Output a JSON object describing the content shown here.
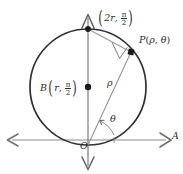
{
  "figure": {
    "type": "geometry-diagram",
    "width": 183,
    "height": 174,
    "background_color": "#ffffff"
  },
  "labels": {
    "top_point": {
      "name": "top-point-label",
      "text": "(2r, π/2)",
      "coordinate_r": "2r",
      "coordinate_theta": "π/2",
      "r_symbol": "2r",
      "theta_num": "π",
      "theta_den": "2",
      "open_paren": "(",
      "close_paren": ")",
      "comma": ", "
    },
    "p_point": {
      "name": "p-point-label",
      "text": "P(ρ, θ)",
      "point_name": "P",
      "open_paren": "(",
      "rho": "ρ",
      "comma": ", ",
      "theta": "θ",
      "close_paren": ")"
    },
    "b_center": {
      "name": "b-center-label",
      "text": "B(r, π/2)",
      "point_name": "B",
      "open_paren": "(",
      "r_symbol": "r",
      "comma": ", ",
      "theta_num": "π",
      "theta_den": "2",
      "close_paren": ")"
    },
    "rho_segment": {
      "name": "rho-segment-label",
      "text": "ρ"
    },
    "theta_angle": {
      "name": "theta-angle-label",
      "text": "θ"
    },
    "origin": {
      "name": "origin-label",
      "text": "O"
    },
    "polar_axis": {
      "name": "polar-axis-label",
      "text": "A"
    }
  },
  "colors": {
    "circle_stroke": "#2f2f2f",
    "axis_stroke": "#8a8a8a",
    "vertical_axis_stroke": "#6f6f6f",
    "radius_line_stroke": "#8f8f8f",
    "chord_stroke": "#9a9a9a",
    "point_fill": "#1a1a1a",
    "text_color": "#2b2b2b",
    "right_angle_stroke": "#7a7a7a"
  },
  "geometry": {
    "circle": {
      "name": "main-circle",
      "center_x": 88,
      "center_y": 87,
      "radius": 58
    },
    "center_point": {
      "name": "center-point-b",
      "x": 88,
      "y": 87,
      "radius": 3.1
    },
    "top_point": {
      "name": "circle-top-point",
      "x": 88,
      "y": 29,
      "radius": 2.8
    },
    "p_point": {
      "name": "point-p",
      "x": 131,
      "y": 52,
      "radius": 3.1
    },
    "origin_point": {
      "name": "origin-point",
      "x": 88,
      "y": 145
    },
    "horizontal_axis": {
      "name": "polar-axis-line",
      "x1": 6,
      "y1": 140,
      "x2": 172,
      "y2": 140
    },
    "vertical_axis": {
      "name": "vertical-axis-line",
      "x1": 88,
      "y1": 14,
      "x2": 88,
      "y2": 170
    },
    "radius_line": {
      "name": "rho-line",
      "x1": 88,
      "y1": 145,
      "x2": 131,
      "y2": 52
    },
    "chord_line": {
      "name": "chord-top-to-p",
      "x1": 88,
      "y1": 29,
      "x2": 131,
      "y2": 52
    },
    "angle_arc": {
      "name": "theta-arc",
      "center_x": 88,
      "center_y": 145,
      "radius": 26
    },
    "right_angle_marker": {
      "name": "right-angle-marker",
      "x": 122,
      "y": 50,
      "size": 10
    }
  }
}
